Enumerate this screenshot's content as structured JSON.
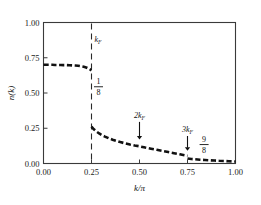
{
  "chart_data": {
    "type": "line",
    "title": "",
    "xlabel": "k/π",
    "ylabel": "n(k)",
    "xlim": [
      0.0,
      1.0
    ],
    "ylim": [
      0.0,
      1.0
    ],
    "grid": false,
    "legend_position": "none",
    "xticks": [
      "0.00",
      "0.25",
      "0.50",
      "0.75",
      "1.00"
    ],
    "xtick_values": [
      0.0,
      0.25,
      0.5,
      0.75,
      1.0
    ],
    "yticks": [
      "0.00",
      "0.25",
      "0.50",
      "0.75",
      "1.00"
    ],
    "ytick_values": [
      0.0,
      0.25,
      0.5,
      0.75,
      1.0
    ],
    "series": [
      {
        "name": "n(k) below kF",
        "style": "dashed-thick",
        "x": [
          0.0,
          0.015,
          0.03,
          0.045,
          0.06,
          0.075,
          0.09,
          0.105,
          0.12,
          0.135,
          0.15,
          0.165,
          0.18,
          0.195,
          0.21,
          0.222,
          0.232,
          0.24,
          0.246,
          0.25
        ],
        "y": [
          0.7,
          0.7,
          0.7,
          0.7,
          0.699,
          0.699,
          0.699,
          0.698,
          0.698,
          0.697,
          0.696,
          0.695,
          0.693,
          0.69,
          0.686,
          0.681,
          0.675,
          0.669,
          0.664,
          0.661
        ]
      },
      {
        "name": "n(k) above kF",
        "style": "dashed-thick",
        "x": [
          0.25,
          0.262,
          0.275,
          0.29,
          0.305,
          0.32,
          0.34,
          0.36,
          0.38,
          0.4,
          0.425,
          0.45,
          0.475,
          0.5,
          0.53,
          0.56,
          0.59,
          0.62,
          0.65,
          0.68,
          0.71,
          0.735,
          0.75
        ],
        "y": [
          0.262,
          0.243,
          0.228,
          0.213,
          0.201,
          0.191,
          0.179,
          0.169,
          0.16,
          0.152,
          0.143,
          0.135,
          0.128,
          0.122,
          0.113,
          0.105,
          0.097,
          0.089,
          0.081,
          0.073,
          0.065,
          0.058,
          0.055
        ]
      },
      {
        "name": "n(k) above 3kF",
        "style": "dashed-thick",
        "x": [
          0.75,
          0.77,
          0.79,
          0.815,
          0.84,
          0.865,
          0.89,
          0.915,
          0.94,
          0.965,
          0.985,
          1.0
        ],
        "y": [
          0.035,
          0.032,
          0.03,
          0.027,
          0.025,
          0.023,
          0.021,
          0.019,
          0.018,
          0.016,
          0.015,
          0.014
        ]
      }
    ],
    "discontinuity": {
      "at_x": 0.25,
      "value_below": 0.661,
      "value_above": 0.262,
      "jump": 0.399
    },
    "vertical_lines": [
      {
        "x": 0.25,
        "style": "dashed",
        "label": "k_F"
      }
    ],
    "annotations": [
      {
        "label": "k_F",
        "text": "k",
        "sub": "F",
        "x": 0.25,
        "y": 0.86
      },
      {
        "label": "one-eighth",
        "numerator": "1",
        "denominator": "8",
        "x": 0.25,
        "y": 0.55
      },
      {
        "label": "2k_F",
        "text": "2k",
        "sub": "F",
        "x": 0.5,
        "y": 0.32,
        "arrow": "down",
        "arrow_to_y": 0.17
      },
      {
        "label": "3k_F",
        "text": "3k",
        "sub": "F",
        "x": 0.75,
        "y": 0.22,
        "arrow": "down",
        "arrow_to_y": 0.09
      },
      {
        "label": "nine-eighths",
        "numerator": "9",
        "denominator": "8",
        "x": 0.8,
        "y": 0.14
      }
    ]
  },
  "style": {
    "curve_color": "#111111",
    "frame_color": "#3a3a3a",
    "dash_color": "#2b2b2b",
    "background": "#ffffff"
  }
}
